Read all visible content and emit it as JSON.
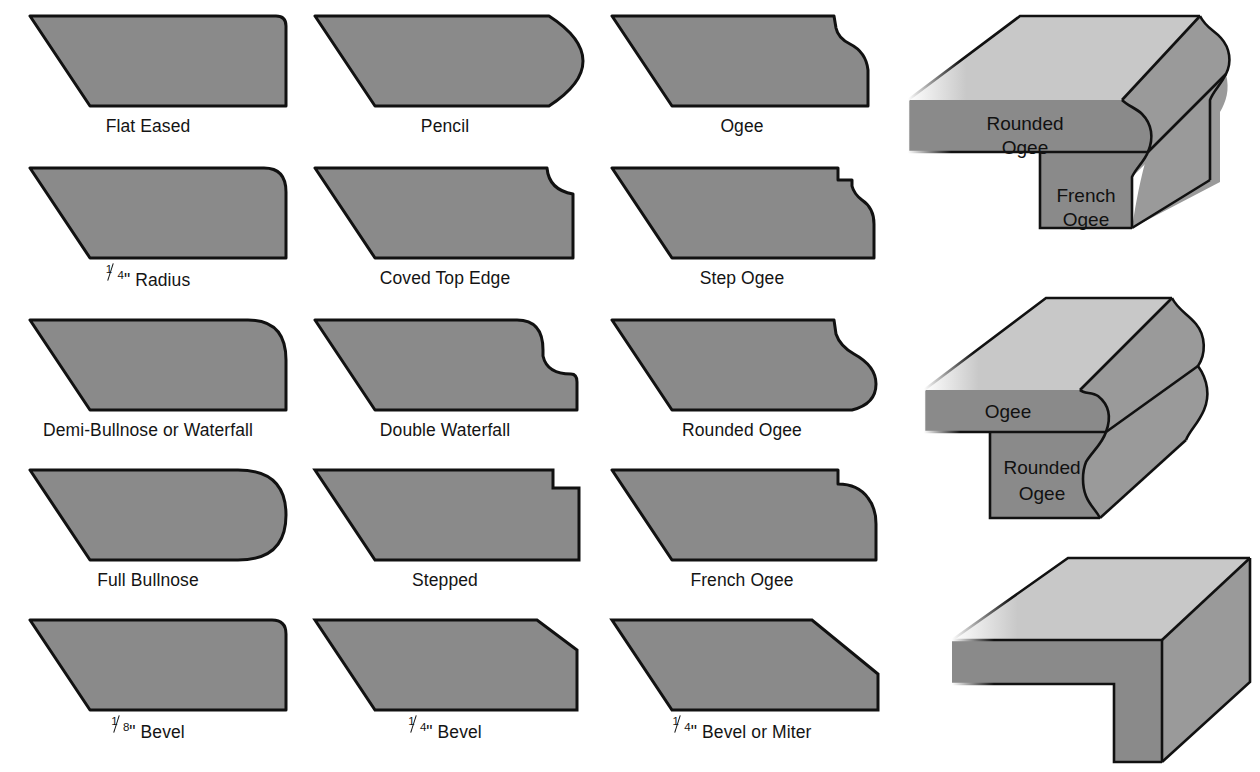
{
  "page": {
    "background_color": "#ffffff",
    "profile_fill": "#8a8a8a",
    "profile_top_face": "#c8c8c8",
    "profile_side_face": "#8a8a8a",
    "outline_color": "#111111",
    "label_color": "#141414"
  },
  "profiles": [
    {
      "id": "flat-eased",
      "label": "Flat Eased",
      "label_plain": "Flat Eased",
      "fraction": null,
      "row": 1,
      "col": 1
    },
    {
      "id": "pencil",
      "label": "Pencil",
      "label_plain": "Pencil",
      "fraction": null,
      "row": 1,
      "col": 2
    },
    {
      "id": "ogee",
      "label": "Ogee",
      "label_plain": "Ogee",
      "fraction": null,
      "row": 1,
      "col": 3
    },
    {
      "id": "quarter-radius",
      "label": "\" Radius",
      "label_plain": "1/4\" Radius",
      "fraction": {
        "num": "1",
        "den": "4"
      },
      "row": 2,
      "col": 1
    },
    {
      "id": "coved-top-edge",
      "label": "Coved Top Edge",
      "label_plain": "Coved Top Edge",
      "fraction": null,
      "row": 2,
      "col": 2
    },
    {
      "id": "step-ogee",
      "label": "Step Ogee",
      "label_plain": "Step Ogee",
      "fraction": null,
      "row": 2,
      "col": 3
    },
    {
      "id": "demi-bullnose",
      "label": "Demi-Bullnose or Waterfall",
      "label_plain": "Demi-Bullnose or Waterfall",
      "fraction": null,
      "row": 3,
      "col": 1
    },
    {
      "id": "double-waterfall",
      "label": "Double Waterfall",
      "label_plain": "Double Waterfall",
      "fraction": null,
      "row": 3,
      "col": 2
    },
    {
      "id": "rounded-ogee",
      "label": "Rounded Ogee",
      "label_plain": "Rounded Ogee",
      "fraction": null,
      "row": 3,
      "col": 3
    },
    {
      "id": "full-bullnose",
      "label": "Full Bullnose",
      "label_plain": "Full Bullnose",
      "fraction": null,
      "row": 4,
      "col": 1
    },
    {
      "id": "stepped",
      "label": "Stepped",
      "label_plain": "Stepped",
      "fraction": null,
      "row": 4,
      "col": 2
    },
    {
      "id": "french-ogee",
      "label": "French Ogee",
      "label_plain": "French Ogee",
      "fraction": null,
      "row": 4,
      "col": 3
    },
    {
      "id": "eighth-bevel",
      "label": "\" Bevel",
      "label_plain": "1/8\" Bevel",
      "fraction": {
        "num": "1",
        "den": "8"
      },
      "row": 5,
      "col": 1
    },
    {
      "id": "quarter-bevel",
      "label": "\" Bevel",
      "label_plain": "1/4\" Bevel",
      "fraction": {
        "num": "1",
        "den": "4"
      },
      "row": 5,
      "col": 2
    },
    {
      "id": "quarter-bevel-miter",
      "label": "\" Bevel or Miter",
      "label_plain": "1/4\" Bevel or Miter",
      "fraction": {
        "num": "1",
        "den": "4"
      },
      "row": 5,
      "col": 3
    }
  ],
  "isometric_figures": [
    {
      "id": "iso-rounded-ogee-french-ogee",
      "captions": [
        {
          "id": "iso1-top-caption",
          "lines": [
            "Rounded",
            "Ogee"
          ]
        },
        {
          "id": "iso1-bottom-caption",
          "lines": [
            "French",
            "Ogee"
          ]
        }
      ]
    },
    {
      "id": "iso-ogee-rounded-ogee",
      "captions": [
        {
          "id": "iso2-top-caption",
          "lines": [
            "Ogee"
          ]
        },
        {
          "id": "iso2-bottom-caption",
          "lines": [
            "Rounded",
            "Ogee"
          ]
        }
      ]
    },
    {
      "id": "iso-square-stepped",
      "captions": []
    }
  ]
}
